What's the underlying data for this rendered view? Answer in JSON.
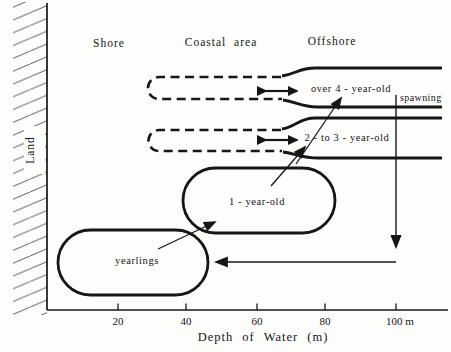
{
  "figure": {
    "regions": {
      "land": "Land",
      "shore": "Shore",
      "coastal": "Coastal area",
      "offshore": "Offshore"
    },
    "groups": {
      "over4": "over 4 - year-old",
      "two_three": "2 - to 3 - year-old",
      "one": "1 - year-old",
      "yearlings": "yearlings"
    },
    "spawning_label": "spawning",
    "axis": {
      "title": "Depth of Water (m)",
      "ticks": [
        "20",
        "40",
        "60",
        "80",
        "100 m"
      ]
    },
    "colors": {
      "ink": "#161616",
      "paper": "#fdfdfb"
    }
  }
}
